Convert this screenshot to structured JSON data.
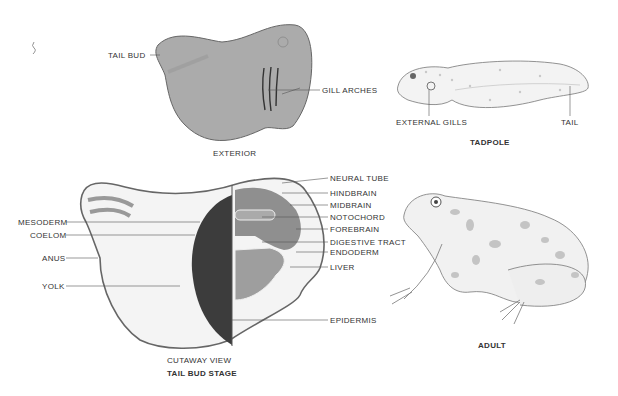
{
  "figure": {
    "exterior": {
      "caption": "EXTERIOR",
      "labels": {
        "tail_bud": "TAIL BUD",
        "gill_arches": "GILL ARCHES"
      }
    },
    "tadpole": {
      "caption": "TADPOLE",
      "labels": {
        "external_gills": "EXTERNAL GILLS",
        "tail": "TAIL"
      }
    },
    "cutaway": {
      "caption": "CUTAWAY VIEW",
      "stage_caption": "TAIL BUD STAGE",
      "left_labels": [
        "MESODERM",
        "COELOM",
        "ANUS",
        "YOLK"
      ],
      "right_labels": [
        "NEURAL TUBE",
        "HINDBRAIN",
        "MIDBRAIN",
        "NOTOCHORD",
        "FOREBRAIN",
        "DIGESTIVE TRACT",
        "ENDODERM",
        "LIVER",
        "EPIDERMIS"
      ]
    },
    "adult": {
      "caption": "ADULT"
    },
    "colors": {
      "shaded_gray": "#a9a9a9",
      "light_fill": "#f2f2f2",
      "line": "#555555",
      "spot": "#c4c4c4"
    }
  }
}
